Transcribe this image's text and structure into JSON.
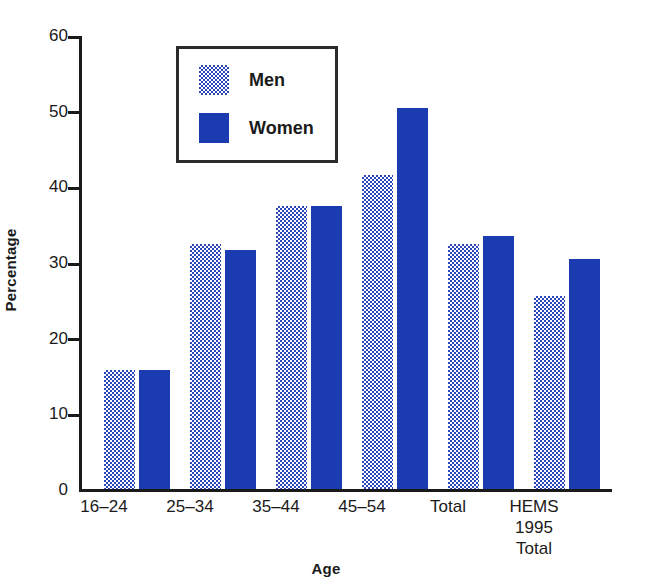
{
  "chart_data": {
    "type": "bar",
    "title": "",
    "xlabel": "Age",
    "ylabel": "Percentage",
    "ylim": [
      0,
      60
    ],
    "yticks": [
      0,
      10,
      20,
      30,
      40,
      50,
      60
    ],
    "grid": false,
    "legend_position": "top-left-inside",
    "categories": [
      "16–24",
      "25–34",
      "35–44",
      "45–54",
      "Total",
      "HEMS\n1995\nTotal"
    ],
    "category_lines": [
      [
        "16–24"
      ],
      [
        "25–34"
      ],
      [
        "35–44"
      ],
      [
        "45–54"
      ],
      [
        "Total"
      ],
      [
        "HEMS",
        "1995",
        "Total"
      ]
    ],
    "series": [
      {
        "name": "Men",
        "color": "#2b46b8",
        "pattern": "stipple",
        "values": [
          15.8,
          32.5,
          37.5,
          41.6,
          32.5,
          25.6
        ]
      },
      {
        "name": "Women",
        "color": "#1a3cb0",
        "pattern": "solid",
        "values": [
          15.8,
          31.6,
          37.5,
          50.4,
          33.5,
          30.4
        ]
      }
    ]
  },
  "legend": {
    "items": [
      {
        "label": "Men",
        "swatch": "men-swatch"
      },
      {
        "label": "Women",
        "swatch": "women-swatch"
      }
    ]
  },
  "axes": {
    "y_title": "Percentage",
    "x_title": "Age",
    "y_tick_labels": [
      "60",
      "50",
      "40",
      "30",
      "20",
      "10",
      "0"
    ]
  },
  "colors": {
    "men": "#2b46b8",
    "women": "#1a3cb0",
    "axis": "#1a1a1a",
    "background": "#ffffff"
  }
}
